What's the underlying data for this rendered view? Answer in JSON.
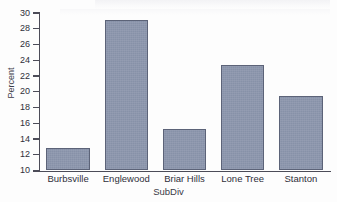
{
  "chart_data": {
    "type": "bar",
    "title": "",
    "subtitle": "",
    "xlabel": "SubDiv",
    "ylabel": "Percent",
    "categories": [
      "Burbsville",
      "Englewood",
      "Briar Hills",
      "Lone Tree",
      "Stanton"
    ],
    "values": [
      12.9,
      29.1,
      15.3,
      23.4,
      19.4
    ],
    "ylim": [
      10,
      30
    ],
    "yticks": [
      10,
      12,
      14,
      16,
      18,
      20,
      22,
      24,
      26,
      28,
      30
    ],
    "ytick_labels": [
      "10",
      "12",
      "14",
      "16",
      "18",
      "20",
      "22",
      "24",
      "26",
      "28",
      "30"
    ],
    "grid": false,
    "legend": null,
    "bar_fill_color": "#8b95ac",
    "bar_edge_color": "#5c6378",
    "axis_color": "#4c4c58",
    "background_color": "#fdfdfd"
  }
}
